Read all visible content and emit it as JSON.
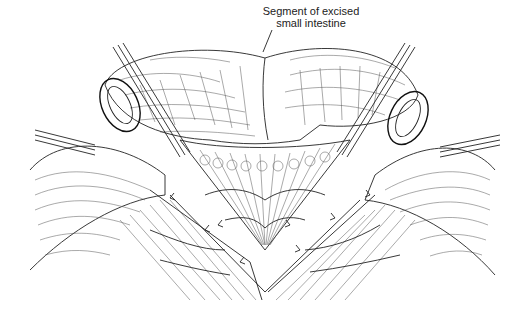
{
  "figure": {
    "type": "medical-illustration",
    "style": "black-and-white line drawing",
    "labels": [
      {
        "id": "excised-segment",
        "line1": "Segment of excised",
        "line2": "small intestine"
      }
    ],
    "colors": {
      "ink": "#222222",
      "background": "#ffffff"
    }
  }
}
